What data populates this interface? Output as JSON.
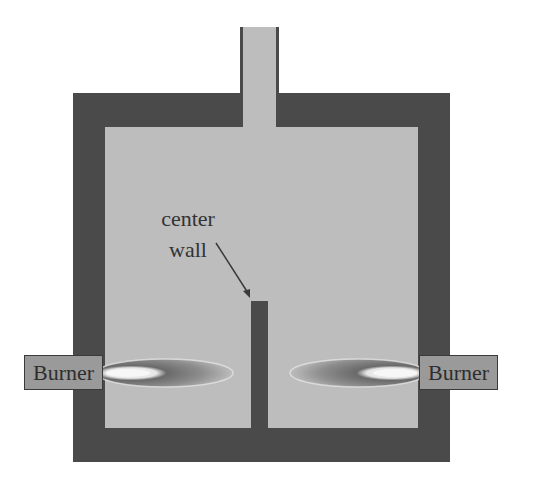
{
  "diagram": {
    "title": "",
    "labels": {
      "center_wall_line1": "center",
      "center_wall_line2": "wall",
      "burner_left": "Burner",
      "burner_right": "Burner"
    },
    "components": [
      {
        "id": "furnace-frame",
        "description": "outer refractory walls (dark)"
      },
      {
        "id": "chamber",
        "description": "combustion chamber interior (light gray)"
      },
      {
        "id": "chimney",
        "description": "exhaust flue at top center"
      },
      {
        "id": "center-wall",
        "description": "partition wall rising from floor at center"
      },
      {
        "id": "burner-left",
        "description": "burner on left wall with flame pointing right"
      },
      {
        "id": "burner-right",
        "description": "burner on right wall with flame pointing left"
      }
    ],
    "colors": {
      "wall": "#4a4a4a",
      "chamber": "#bdbdbd",
      "burner_box": "#9a9a9a",
      "flame_core": "#f2f2f2",
      "flame_outer": "#6e6e6e",
      "text": "#333333"
    }
  }
}
